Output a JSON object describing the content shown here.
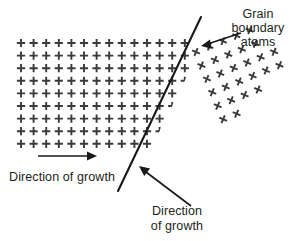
{
  "figure": {
    "background_color": "#ffffff",
    "ink_color": "#231f20",
    "atom_color": "#3a3a3a",
    "width": 297,
    "height": 241
  },
  "labels": {
    "grain_boundary": {
      "line1": "Grain",
      "line2": "boundary",
      "line3": "atoms"
    },
    "growth_left": "Direction of growth",
    "growth_bottom": {
      "line1": "Direction",
      "line2": "of growth"
    }
  },
  "icons": {
    "plus_atom": "plus-atom-icon",
    "cross_atom": "cross-atom-icon",
    "arrow_right": "arrow-right-icon",
    "arrow_diagonal": "arrow-diagonal-icon"
  },
  "chart_data": {
    "type": "diagram",
    "grain_left": {
      "symbol": "+",
      "lattice": "square, unrotated",
      "rotation_deg": 0,
      "spacing_px": 12.6,
      "origin_px": [
        21,
        43
      ],
      "rows": 9,
      "columns_per_row": [
        14,
        14,
        14,
        14,
        13,
        13,
        12,
        12,
        11
      ]
    },
    "grain_right": {
      "symbol": "x",
      "lattice": "square, rotated",
      "rotation_deg": -22,
      "spacing_px": 14.5,
      "origin_px": [
        196,
        52
      ],
      "rows": 9,
      "columns": 9
    },
    "grain_boundary": {
      "from_px": [
        201,
        17
      ],
      "to_px": [
        118,
        191
      ],
      "angle_deg": -64
    },
    "annotations": [
      {
        "text": "Grain boundary atoms",
        "arrow_from_px": [
          240,
          34
        ],
        "arrow_to_px": [
          202,
          46
        ],
        "direction": "down-left"
      },
      {
        "text": "Direction of growth",
        "arrow_from_px": [
          38,
          156
        ],
        "arrow_to_px": [
          96,
          156
        ],
        "direction": "right"
      },
      {
        "text": "Direction of growth",
        "arrow_from_px": [
          190,
          205
        ],
        "arrow_to_px": [
          139,
          166
        ],
        "direction": "up-left"
      }
    ]
  }
}
